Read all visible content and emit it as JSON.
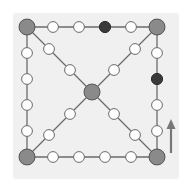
{
  "board": {
    "background": "#f0f0f0",
    "line_color": "#6b6b6b",
    "corner_fill": "#8a8a8a",
    "empty_fill": "#ffffff",
    "dark_fill": "#3a3a3a",
    "arrow_color": "#777777"
  },
  "corners": [
    {
      "id": "top-left",
      "x": 27,
      "y": 27
    },
    {
      "id": "top-right",
      "x": 157,
      "y": 27
    },
    {
      "id": "bottom-left",
      "x": 27,
      "y": 157
    },
    {
      "id": "bottom-right",
      "x": 157,
      "y": 157
    },
    {
      "id": "center",
      "x": 92,
      "y": 92
    }
  ],
  "edge_nodes": [
    {
      "edge": "top",
      "x": 53,
      "y": 27,
      "state": "empty"
    },
    {
      "edge": "top",
      "x": 79,
      "y": 27,
      "state": "empty"
    },
    {
      "edge": "top",
      "x": 105,
      "y": 27,
      "state": "dark"
    },
    {
      "edge": "top",
      "x": 131,
      "y": 27,
      "state": "empty"
    },
    {
      "edge": "bottom",
      "x": 53,
      "y": 157,
      "state": "empty"
    },
    {
      "edge": "bottom",
      "x": 79,
      "y": 157,
      "state": "empty"
    },
    {
      "edge": "bottom",
      "x": 105,
      "y": 157,
      "state": "empty"
    },
    {
      "edge": "bottom",
      "x": 131,
      "y": 157,
      "state": "empty"
    },
    {
      "edge": "left",
      "x": 27,
      "y": 53,
      "state": "empty"
    },
    {
      "edge": "left",
      "x": 27,
      "y": 79,
      "state": "empty"
    },
    {
      "edge": "left",
      "x": 27,
      "y": 105,
      "state": "empty"
    },
    {
      "edge": "left",
      "x": 27,
      "y": 131,
      "state": "empty"
    },
    {
      "edge": "right",
      "x": 157,
      "y": 53,
      "state": "empty"
    },
    {
      "edge": "right",
      "x": 157,
      "y": 79,
      "state": "dark"
    },
    {
      "edge": "right",
      "x": 157,
      "y": 105,
      "state": "empty"
    },
    {
      "edge": "right",
      "x": 157,
      "y": 131,
      "state": "empty"
    },
    {
      "edge": "diag-tl",
      "x": 49,
      "y": 49,
      "state": "empty"
    },
    {
      "edge": "diag-tl",
      "x": 70,
      "y": 70,
      "state": "empty"
    },
    {
      "edge": "diag-tr",
      "x": 135,
      "y": 49,
      "state": "empty"
    },
    {
      "edge": "diag-tr",
      "x": 114,
      "y": 70,
      "state": "empty"
    },
    {
      "edge": "diag-bl",
      "x": 49,
      "y": 135,
      "state": "empty"
    },
    {
      "edge": "diag-bl",
      "x": 70,
      "y": 114,
      "state": "empty"
    },
    {
      "edge": "diag-br",
      "x": 135,
      "y": 135,
      "state": "empty"
    },
    {
      "edge": "diag-br",
      "x": 114,
      "y": 114,
      "state": "empty"
    }
  ],
  "arrow": {
    "direction": "up",
    "x": 171,
    "y_start": 153,
    "y_end": 119
  }
}
